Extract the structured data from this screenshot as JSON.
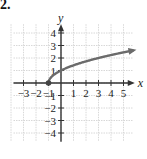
{
  "problem_label": "2.",
  "chart_data": {
    "type": "line",
    "title": "",
    "function": "y = sqrt(x + 1)",
    "xlabel": "x",
    "ylabel": "y",
    "xlim": [
      -4,
      6
    ],
    "ylim": [
      -5,
      5
    ],
    "x_ticks": [
      -3,
      -2,
      -1,
      1,
      2,
      3,
      4,
      5
    ],
    "y_ticks": [
      -4,
      -3,
      -2,
      -1,
      1,
      2,
      3,
      4
    ],
    "grid": true,
    "legend": null,
    "series": [
      {
        "name": "sqrt(x+1)",
        "x": [
          -1,
          -0.75,
          0,
          1,
          2,
          3,
          4,
          5,
          5.8
        ],
        "y": [
          0,
          0.5,
          1,
          1.414,
          1.732,
          2,
          2.236,
          2.449,
          2.608
        ],
        "start_point": {
          "x": -1,
          "y": 0,
          "style": "filled-dot"
        },
        "end": "arrow",
        "color": "#6b6b6b"
      }
    ]
  }
}
